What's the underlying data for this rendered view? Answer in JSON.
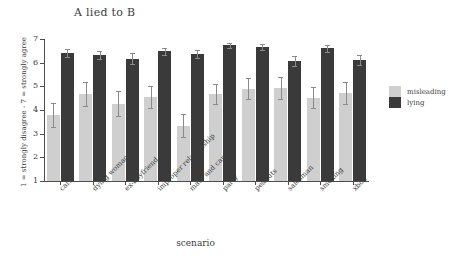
{
  "chart_data": {
    "type": "bar",
    "title": "A lied to B",
    "xlabel": "scenario",
    "ylabel": "1 = strongly disagree - 7 = strongly agree",
    "ylim": [
      1,
      7
    ],
    "yticks": [
      1,
      2,
      3,
      4,
      5,
      6,
      7
    ],
    "grid": false,
    "legend_position": "right",
    "categories": [
      "cars",
      "dying woman",
      "ex-boyfriend",
      "improper relationship",
      "mate and captain",
      "party",
      "peanuts",
      "salesman",
      "smoking",
      "xbox"
    ],
    "series": [
      {
        "name": "misleading",
        "color": "#cfcfcf",
        "values": [
          3.8,
          4.68,
          4.27,
          4.55,
          3.33,
          4.68,
          4.9,
          4.93,
          4.52,
          4.72
        ],
        "errors": [
          0.5,
          0.5,
          0.52,
          0.48,
          0.48,
          0.42,
          0.45,
          0.48,
          0.45,
          0.48
        ]
      },
      {
        "name": "lying",
        "color": "#3a3a3a",
        "values": [
          6.4,
          6.32,
          6.17,
          6.48,
          6.35,
          6.73,
          6.65,
          6.08,
          6.6,
          6.12
        ],
        "errors": [
          0.17,
          0.18,
          0.22,
          0.15,
          0.17,
          0.1,
          0.13,
          0.22,
          0.13,
          0.2
        ]
      }
    ]
  },
  "legend": {
    "items": [
      {
        "label": "misleading",
        "swatch": "misleading"
      },
      {
        "label": "lying",
        "swatch": "lying"
      }
    ]
  }
}
